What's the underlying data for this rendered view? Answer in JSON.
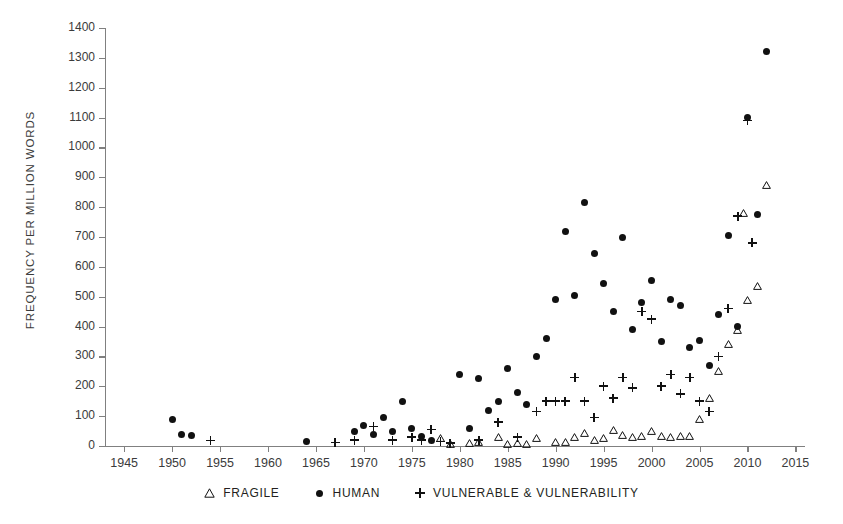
{
  "chart_data": {
    "type": "scatter",
    "title": "",
    "xlabel": "",
    "ylabel": "FREQUENCY PER MILLION WORDS",
    "xlim": [
      1943,
      2016
    ],
    "ylim": [
      0,
      1400
    ],
    "grid": false,
    "legend_position": "bottom",
    "xticks": [
      1945,
      1950,
      1955,
      1960,
      1965,
      1970,
      1975,
      1980,
      1985,
      1990,
      1995,
      2000,
      2005,
      2010,
      2015
    ],
    "yticks": [
      0,
      100,
      200,
      300,
      400,
      500,
      600,
      700,
      800,
      900,
      1000,
      1100,
      1200,
      1300,
      1400
    ],
    "series": [
      {
        "name": "FRAGILE",
        "marker": "triangle-open",
        "color": "#111111",
        "points": [
          [
            1978,
            28
          ],
          [
            1979,
            8
          ],
          [
            1981,
            10
          ],
          [
            1982,
            12
          ],
          [
            1984,
            30
          ],
          [
            1985,
            8
          ],
          [
            1986,
            10
          ],
          [
            1987,
            7
          ],
          [
            1988,
            28
          ],
          [
            1990,
            12
          ],
          [
            1991,
            14
          ],
          [
            1992,
            30
          ],
          [
            1993,
            42
          ],
          [
            1994,
            20
          ],
          [
            1995,
            28
          ],
          [
            1996,
            55
          ],
          [
            1997,
            36
          ],
          [
            1998,
            30
          ],
          [
            1999,
            35
          ],
          [
            2000,
            50
          ],
          [
            2001,
            32
          ],
          [
            2002,
            30
          ],
          [
            2003,
            35
          ],
          [
            2004,
            32
          ],
          [
            2005,
            90
          ],
          [
            2006,
            160
          ],
          [
            2007,
            250
          ],
          [
            2008,
            340
          ],
          [
            2009,
            390
          ],
          [
            2010,
            490
          ],
          [
            2011,
            535
          ],
          [
            2012,
            875
          ],
          [
            2009.6,
            780
          ]
        ]
      },
      {
        "name": "HUMAN",
        "marker": "circle-filled",
        "color": "#111111",
        "points": [
          [
            1950,
            90
          ],
          [
            1951,
            40
          ],
          [
            1952,
            35
          ],
          [
            1964,
            15
          ],
          [
            1969,
            50
          ],
          [
            1970,
            70
          ],
          [
            1971,
            40
          ],
          [
            1972,
            95
          ],
          [
            1973,
            50
          ],
          [
            1974,
            150
          ],
          [
            1975,
            60
          ],
          [
            1976,
            32
          ],
          [
            1977,
            18
          ],
          [
            1980,
            240
          ],
          [
            1981,
            60
          ],
          [
            1982,
            225
          ],
          [
            1983,
            120
          ],
          [
            1984,
            150
          ],
          [
            1985,
            260
          ],
          [
            1986,
            180
          ],
          [
            1987,
            140
          ],
          [
            1988,
            300
          ],
          [
            1989,
            360
          ],
          [
            1990,
            490
          ],
          [
            1991,
            720
          ],
          [
            1992,
            505
          ],
          [
            1993,
            815
          ],
          [
            1994,
            645
          ],
          [
            1995,
            545
          ],
          [
            1996,
            450
          ],
          [
            1997,
            700
          ],
          [
            1998,
            390
          ],
          [
            1999,
            480
          ],
          [
            2000,
            555
          ],
          [
            2001,
            350
          ],
          [
            2002,
            490
          ],
          [
            2003,
            470
          ],
          [
            2004,
            330
          ],
          [
            2005,
            355
          ],
          [
            2006,
            270
          ],
          [
            2007,
            440
          ],
          [
            2008,
            705
          ],
          [
            2009,
            400
          ],
          [
            2010,
            1100
          ],
          [
            2011,
            775
          ],
          [
            2012,
            1320
          ]
        ]
      },
      {
        "name": "VULNERABLE & VULNERABILITY",
        "marker": "plus",
        "color": "#111111",
        "points": [
          [
            1954,
            18
          ],
          [
            1967,
            12
          ],
          [
            1969,
            20
          ],
          [
            1971,
            65
          ],
          [
            1973,
            20
          ],
          [
            1975,
            30
          ],
          [
            1976,
            20
          ],
          [
            1977,
            55
          ],
          [
            1978,
            15
          ],
          [
            1979,
            10
          ],
          [
            1982,
            20
          ],
          [
            1984,
            80
          ],
          [
            1986,
            30
          ],
          [
            1988,
            115
          ],
          [
            1989,
            150
          ],
          [
            1990,
            150
          ],
          [
            1991,
            150
          ],
          [
            1992,
            230
          ],
          [
            1993,
            150
          ],
          [
            1994,
            95
          ],
          [
            1995,
            200
          ],
          [
            1996,
            160
          ],
          [
            1997,
            230
          ],
          [
            1998,
            195
          ],
          [
            1999,
            450
          ],
          [
            2000,
            425
          ],
          [
            2001,
            200
          ],
          [
            2002,
            240
          ],
          [
            2003,
            175
          ],
          [
            2004,
            230
          ],
          [
            2005,
            150
          ],
          [
            2006,
            115
          ],
          [
            2007,
            300
          ],
          [
            2008,
            460
          ],
          [
            2009,
            770
          ],
          [
            2010,
            1090
          ],
          [
            2010.5,
            680
          ]
        ]
      }
    ]
  },
  "legend": {
    "items": [
      {
        "label": "FRAGILE",
        "symbol": "triangle-open-icon"
      },
      {
        "label": "HUMAN",
        "symbol": "circle-filled-icon"
      },
      {
        "label": "VULNERABLE & VULNERABILITY",
        "symbol": "plus-icon"
      }
    ]
  }
}
